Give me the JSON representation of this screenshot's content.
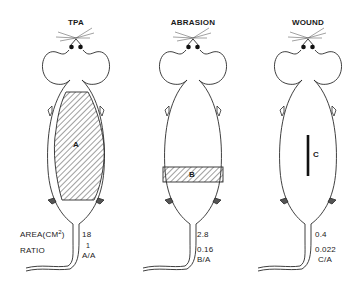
{
  "panels": [
    {
      "title": "TPA",
      "region_label": "A",
      "area": "18",
      "ratio": "1",
      "ratio_label": "A/A"
    },
    {
      "title": "ABRASION",
      "region_label": "B",
      "area": "2.8",
      "ratio": "0.16",
      "ratio_label": "B/A"
    },
    {
      "title": "WOUND",
      "region_label": "C",
      "area": "0.4",
      "ratio": "0.022",
      "ratio_label": "C/A"
    }
  ],
  "row_labels": {
    "area_prefix": "AREA(CM",
    "area_sup": "2",
    "area_suffix": ")",
    "ratio": "RATIO"
  },
  "colors": {
    "line": "#2a2a2a",
    "background": "#ffffff"
  }
}
